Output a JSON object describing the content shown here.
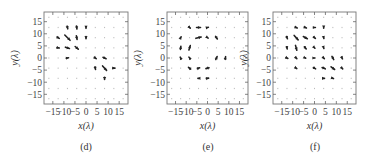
{
  "figure": {
    "panels": [
      {
        "id": "d",
        "caption": "(d)",
        "xlabel": "x(λ)",
        "ylabel": "y(λ)"
      },
      {
        "id": "e",
        "caption": "(e)",
        "xlabel": "x(λ)",
        "ylabel": "y(λ)"
      },
      {
        "id": "f",
        "caption": "(f)",
        "xlabel": "x(λ)",
        "ylabel": "y(λ)"
      }
    ]
  },
  "chart_data": [
    {
      "type": "quiver",
      "title": "(d)",
      "xlabel": "x(λ)",
      "ylabel": "y(λ)",
      "xticks": [
        -15,
        -10,
        -5,
        0,
        5,
        10,
        15
      ],
      "yticks": [
        -15,
        -10,
        -5,
        0,
        5,
        10,
        15
      ],
      "xlim": [
        -19,
        19
      ],
      "ylim": [
        -19,
        19
      ],
      "grid_step": 4.2,
      "vectors": [
        {
          "x": -8.4,
          "y": 12.6,
          "u": 0.3,
          "v": -1.2
        },
        {
          "x": -4.2,
          "y": 12.6,
          "u": 0.2,
          "v": -1.4
        },
        {
          "x": 0,
          "y": 12.6,
          "u": 0,
          "v": -0.8
        },
        {
          "x": -12.6,
          "y": 8.4,
          "u": 1,
          "v": -0.6
        },
        {
          "x": -8.4,
          "y": 8.4,
          "u": 2.4,
          "v": -2.4
        },
        {
          "x": -4.2,
          "y": 8.4,
          "u": 0.3,
          "v": -1.6
        },
        {
          "x": 0,
          "y": 8.4,
          "u": 0,
          "v": -1
        },
        {
          "x": -12.6,
          "y": 4.2,
          "u": 1,
          "v": -0.2
        },
        {
          "x": -8.4,
          "y": 4.2,
          "u": 1.8,
          "v": -0.6
        },
        {
          "x": -4.2,
          "y": 4.2,
          "u": 1.4,
          "v": -1.2
        },
        {
          "x": -8.4,
          "y": 0,
          "u": 1,
          "v": 0.2
        },
        {
          "x": 4.2,
          "y": 0,
          "u": 0.8,
          "v": -0.6
        },
        {
          "x": 8.4,
          "y": 0,
          "u": 1.4,
          "v": -0.6
        },
        {
          "x": 4.2,
          "y": -4.2,
          "u": 0.2,
          "v": -1.2
        },
        {
          "x": 8.4,
          "y": -4.2,
          "u": 1.8,
          "v": -2
        },
        {
          "x": 12.6,
          "y": -4.2,
          "u": 1,
          "v": 0
        },
        {
          "x": 8.4,
          "y": -8.4,
          "u": 0,
          "v": -1
        }
      ]
    },
    {
      "type": "quiver",
      "title": "(e)",
      "xlabel": "x(λ)",
      "ylabel": "y(λ)",
      "xticks": [
        -15,
        -10,
        -5,
        0,
        5,
        10,
        15
      ],
      "yticks": [
        -15,
        -10,
        -5,
        0,
        5,
        10,
        15
      ],
      "xlim": [
        -19,
        19
      ],
      "ylim": [
        -19,
        19
      ],
      "grid_step": 4.2,
      "vectors": [
        {
          "x": -8.4,
          "y": 12.6,
          "u": 0.6,
          "v": -0.6
        },
        {
          "x": -4.2,
          "y": 12.6,
          "u": 1.8,
          "v": 0
        },
        {
          "x": 0,
          "y": 12.6,
          "u": 0.8,
          "v": 0.2
        },
        {
          "x": -12.6,
          "y": 8.4,
          "u": 0.4,
          "v": 0.8
        },
        {
          "x": -4.2,
          "y": 8.4,
          "u": 2.4,
          "v": 0.6
        },
        {
          "x": 0,
          "y": 8.4,
          "u": 0.6,
          "v": -0.4
        },
        {
          "x": 4.2,
          "y": 8.4,
          "u": 0.8,
          "v": -1.2
        },
        {
          "x": -12.6,
          "y": 4.2,
          "u": 0.2,
          "v": 1.4
        },
        {
          "x": -8.4,
          "y": 4.2,
          "u": 0.6,
          "v": 2
        },
        {
          "x": -12.6,
          "y": 0,
          "u": -0.4,
          "v": 0.8
        },
        {
          "x": -8.4,
          "y": 0,
          "u": -0.6,
          "v": 0.8
        },
        {
          "x": 4.2,
          "y": 0,
          "u": 0.6,
          "v": 1.4
        },
        {
          "x": 8.4,
          "y": 0,
          "u": 0.2,
          "v": 1.2
        },
        {
          "x": -8.4,
          "y": -4.2,
          "u": -1,
          "v": 0.8
        },
        {
          "x": -4.2,
          "y": -4.2,
          "u": 1,
          "v": 0.4
        },
        {
          "x": 0,
          "y": -4.2,
          "u": -1.4,
          "v": -0.4
        },
        {
          "x": -4.2,
          "y": -8.4,
          "u": -0.6,
          "v": 0
        },
        {
          "x": 0,
          "y": -8.4,
          "u": 1,
          "v": 0.2
        }
      ]
    },
    {
      "type": "quiver",
      "title": "(f)",
      "xlabel": "x(λ)",
      "ylabel": "y(λ)",
      "xticks": [
        -15,
        -10,
        -5,
        0,
        5,
        10,
        15
      ],
      "yticks": [
        -15,
        -10,
        -5,
        0,
        5,
        10,
        15
      ],
      "xlim": [
        -19,
        19
      ],
      "ylim": [
        -19,
        19
      ],
      "grid_step": 4.2,
      "vectors": [
        {
          "x": -8.4,
          "y": 12.6,
          "u": 1,
          "v": -0.4
        },
        {
          "x": -4.2,
          "y": 12.6,
          "u": 1,
          "v": -0.4
        },
        {
          "x": 0,
          "y": 12.6,
          "u": 0.8,
          "v": 0
        },
        {
          "x": 4.2,
          "y": 12.6,
          "u": 0,
          "v": -0.6
        },
        {
          "x": -12.6,
          "y": 8.4,
          "u": 0.4,
          "v": -1
        },
        {
          "x": -8.4,
          "y": 8.4,
          "u": 1.8,
          "v": -2
        },
        {
          "x": -4.2,
          "y": 8.4,
          "u": 1.8,
          "v": -1
        },
        {
          "x": 0,
          "y": 8.4,
          "u": 0.8,
          "v": -0.6
        },
        {
          "x": 4.2,
          "y": 8.4,
          "u": 0.2,
          "v": -0.8
        },
        {
          "x": -12.6,
          "y": 4.2,
          "u": 0.2,
          "v": -1
        },
        {
          "x": -8.4,
          "y": 4.2,
          "u": 0.6,
          "v": -2.2
        },
        {
          "x": -4.2,
          "y": 4.2,
          "u": 0.8,
          "v": -1
        },
        {
          "x": 0,
          "y": 4.2,
          "u": 0.4,
          "v": -0.4
        },
        {
          "x": 4.2,
          "y": 4.2,
          "u": 0.2,
          "v": -0.6
        },
        {
          "x": -12.6,
          "y": 0,
          "u": 0.8,
          "v": -0.4
        },
        {
          "x": -8.4,
          "y": 0,
          "u": 0.6,
          "v": -0.6
        },
        {
          "x": -4.2,
          "y": 0,
          "u": 0.4,
          "v": -0.2
        },
        {
          "x": 0,
          "y": 0,
          "u": 0.4,
          "v": 0
        },
        {
          "x": 4.2,
          "y": 0,
          "u": 0.6,
          "v": -0.6
        },
        {
          "x": 8.4,
          "y": 0,
          "u": 0.8,
          "v": -1.4
        },
        {
          "x": 12.6,
          "y": 0,
          "u": 0.4,
          "v": -0.8
        },
        {
          "x": -8.4,
          "y": -4.2,
          "u": 0.6,
          "v": -0.4
        },
        {
          "x": 0,
          "y": -4.2,
          "u": 1,
          "v": -0.6
        },
        {
          "x": 4.2,
          "y": -4.2,
          "u": 1.4,
          "v": -0.6
        },
        {
          "x": 8.4,
          "y": -4.2,
          "u": 1.6,
          "v": -1.2
        },
        {
          "x": 12.6,
          "y": -4.2,
          "u": 0.6,
          "v": -0.6
        },
        {
          "x": 4.2,
          "y": -8.4,
          "u": 0.8,
          "v": 0
        },
        {
          "x": 8.4,
          "y": -8.4,
          "u": 0.6,
          "v": -0.2
        }
      ]
    }
  ]
}
